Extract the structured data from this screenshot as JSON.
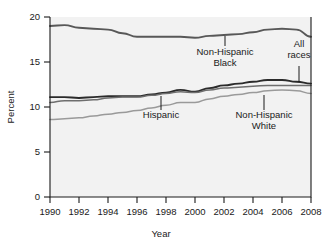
{
  "chart_data": {
    "type": "line",
    "title": "",
    "xlabel": "Year",
    "ylabel": "Percent",
    "xlim": [
      1990,
      2008
    ],
    "ylim": [
      0,
      20
    ],
    "yticks": [
      0,
      5,
      10,
      15,
      20
    ],
    "xticks": [
      1990,
      1992,
      1994,
      1996,
      1998,
      2000,
      2002,
      2004,
      2006,
      2008
    ],
    "xtick_labels": [
      "1990",
      "1992",
      "1994",
      "1996",
      "1998",
      "2000",
      "2002",
      "2004",
      "2006",
      "2008"
    ],
    "ytick_labels": [
      "0",
      "5",
      "10",
      "15",
      "20"
    ],
    "grid": false,
    "legend": "none (inline annotations with leader lines)",
    "x": [
      1990,
      1991,
      1992,
      1993,
      1994,
      1995,
      1996,
      1997,
      1998,
      1999,
      2000,
      2001,
      2002,
      2003,
      2004,
      2005,
      2006,
      2007,
      2008
    ],
    "series": [
      {
        "name": "Non-Hispanic Black",
        "color": "#585858",
        "width": 1.9,
        "values": [
          19.0,
          19.1,
          18.8,
          18.7,
          18.6,
          18.2,
          17.8,
          17.8,
          17.8,
          17.8,
          17.7,
          17.9,
          18.0,
          18.1,
          18.3,
          18.6,
          18.7,
          18.6,
          17.8
        ]
      },
      {
        "name": "All races",
        "color": "#2b2b2b",
        "width": 1.9,
        "values": [
          11.1,
          11.1,
          11.0,
          11.1,
          11.2,
          11.2,
          11.2,
          11.4,
          11.6,
          11.9,
          11.7,
          12.1,
          12.4,
          12.6,
          12.8,
          13.0,
          13.0,
          12.8,
          12.6
        ]
      },
      {
        "name": "Non-Hispanic White",
        "color": "#6e6e6e",
        "width": 1.5,
        "values": [
          10.5,
          10.7,
          10.7,
          10.8,
          11.0,
          11.1,
          11.1,
          11.3,
          11.5,
          11.7,
          11.6,
          11.9,
          12.1,
          12.2,
          12.3,
          12.4,
          12.4,
          12.4,
          12.4
        ]
      },
      {
        "name": "Hispanic",
        "color": "#9a9a9a",
        "width": 1.5,
        "values": [
          8.6,
          8.7,
          8.8,
          9.0,
          9.2,
          9.4,
          9.6,
          9.9,
          10.2,
          10.5,
          10.5,
          10.9,
          11.2,
          11.4,
          11.6,
          11.8,
          11.9,
          11.8,
          11.5
        ]
      }
    ],
    "annotations": [
      {
        "id": "non-hispanic-black",
        "text_lines": [
          "Non-Hispanic",
          "Black"
        ],
        "text_x": 225,
        "text_y": 55,
        "leader_x": 225,
        "leader_y1": 36,
        "leader_y2": 46
      },
      {
        "id": "all-races",
        "text_lines": [
          "All",
          "races"
        ],
        "text_x": 299,
        "text_y": 47,
        "leader_x": 299,
        "leader_y1": 66,
        "leader_y2": 82
      },
      {
        "id": "hispanic",
        "text_lines": [
          "Hispanic"
        ],
        "text_x": 161,
        "text_y": 118,
        "leader_x": 161,
        "leader_y1": 96,
        "leader_y2": 110
      },
      {
        "id": "non-hispanic-white",
        "text_lines": [
          "Non-Hispanic",
          "White"
        ],
        "text_x": 264,
        "text_y": 118,
        "leader_x": 264,
        "leader_y1": 95,
        "leader_y2": 110
      }
    ],
    "style": {
      "plot_background": "#f2f2f2",
      "figure_background": "#ffffff",
      "axis_color": "#1a1a1a"
    }
  }
}
